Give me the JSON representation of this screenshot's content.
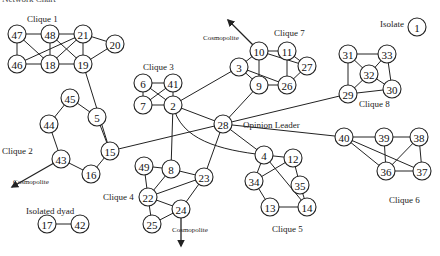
{
  "title": "Network Chart",
  "labels": {
    "clique1": {
      "text": "Clique 1",
      "x": 27,
      "y": 22
    },
    "clique2": {
      "text": "Clique 2",
      "x": 2,
      "y": 154
    },
    "clique3": {
      "text": "Clique 3",
      "x": 143,
      "y": 70
    },
    "clique4": {
      "text": "Clique 4",
      "x": 103,
      "y": 200
    },
    "clique5": {
      "text": "Clique 5",
      "x": 272,
      "y": 232
    },
    "clique6": {
      "text": "Clique 6",
      "x": 389,
      "y": 203
    },
    "clique7": {
      "text": "Clique 7",
      "x": 274,
      "y": 36
    },
    "clique8": {
      "text": "Clique 8",
      "x": 359,
      "y": 107
    },
    "isolate": {
      "text": "Isolate",
      "x": 380,
      "y": 27
    },
    "isolated_dyad": {
      "text": "Isolated dyad",
      "x": 26,
      "y": 214
    },
    "opinion_leader": {
      "text": "Opinion Leader",
      "x": 243,
      "y": 128
    },
    "cosmopolite_top": {
      "text": "Cosmopolite",
      "x": 203,
      "y": 40
    },
    "cosmopolite_left": {
      "text": "Cosmopolite",
      "x": 13,
      "y": 184
    },
    "cosmopolite_bottom": {
      "text": "Cosmopolite",
      "x": 172,
      "y": 232
    }
  },
  "nodes": [
    {
      "id": "47",
      "x": 17,
      "y": 34
    },
    {
      "id": "48",
      "x": 50,
      "y": 34
    },
    {
      "id": "21",
      "x": 83,
      "y": 34
    },
    {
      "id": "20",
      "x": 115,
      "y": 44
    },
    {
      "id": "46",
      "x": 17,
      "y": 64
    },
    {
      "id": "18",
      "x": 50,
      "y": 64
    },
    {
      "id": "19",
      "x": 83,
      "y": 64
    },
    {
      "id": "6",
      "x": 143,
      "y": 83
    },
    {
      "id": "41",
      "x": 173,
      "y": 83
    },
    {
      "id": "7",
      "x": 143,
      "y": 105
    },
    {
      "id": "2",
      "x": 173,
      "y": 105
    },
    {
      "id": "45",
      "x": 70,
      "y": 98
    },
    {
      "id": "5",
      "x": 97,
      "y": 117
    },
    {
      "id": "44",
      "x": 49,
      "y": 124
    },
    {
      "id": "15",
      "x": 110,
      "y": 151
    },
    {
      "id": "43",
      "x": 61,
      "y": 159
    },
    {
      "id": "16",
      "x": 91,
      "y": 174
    },
    {
      "id": "17",
      "x": 47,
      "y": 224
    },
    {
      "id": "42",
      "x": 80,
      "y": 224
    },
    {
      "id": "28",
      "x": 223,
      "y": 124
    },
    {
      "id": "10",
      "x": 259,
      "y": 51
    },
    {
      "id": "11",
      "x": 287,
      "y": 51
    },
    {
      "id": "27",
      "x": 307,
      "y": 66
    },
    {
      "id": "3",
      "x": 239,
      "y": 67
    },
    {
      "id": "9",
      "x": 259,
      "y": 85
    },
    {
      "id": "26",
      "x": 287,
      "y": 85
    },
    {
      "id": "31",
      "x": 348,
      "y": 54
    },
    {
      "id": "33",
      "x": 387,
      "y": 54
    },
    {
      "id": "32",
      "x": 369,
      "y": 74
    },
    {
      "id": "29",
      "x": 348,
      "y": 94
    },
    {
      "id": "30",
      "x": 392,
      "y": 89
    },
    {
      "id": "1",
      "x": 417,
      "y": 27
    },
    {
      "id": "40",
      "x": 344,
      "y": 137
    },
    {
      "id": "39",
      "x": 384,
      "y": 137
    },
    {
      "id": "38",
      "x": 419,
      "y": 137
    },
    {
      "id": "36",
      "x": 386,
      "y": 171
    },
    {
      "id": "37",
      "x": 422,
      "y": 171
    },
    {
      "id": "4",
      "x": 264,
      "y": 155
    },
    {
      "id": "12",
      "x": 293,
      "y": 158
    },
    {
      "id": "34",
      "x": 254,
      "y": 181
    },
    {
      "id": "35",
      "x": 300,
      "y": 185
    },
    {
      "id": "13",
      "x": 270,
      "y": 207
    },
    {
      "id": "14",
      "x": 307,
      "y": 207
    },
    {
      "id": "49",
      "x": 144,
      "y": 166
    },
    {
      "id": "8",
      "x": 171,
      "y": 169
    },
    {
      "id": "23",
      "x": 204,
      "y": 177
    },
    {
      "id": "22",
      "x": 148,
      "y": 197
    },
    {
      "id": "24",
      "x": 181,
      "y": 209
    },
    {
      "id": "25",
      "x": 152,
      "y": 224
    }
  ],
  "edges": [
    [
      "47",
      "48"
    ],
    [
      "48",
      "21"
    ],
    [
      "21",
      "20"
    ],
    [
      "47",
      "46"
    ],
    [
      "46",
      "18"
    ],
    [
      "18",
      "19"
    ],
    [
      "19",
      "20"
    ],
    [
      "47",
      "18"
    ],
    [
      "48",
      "18"
    ],
    [
      "48",
      "19"
    ],
    [
      "21",
      "18"
    ],
    [
      "21",
      "19"
    ],
    [
      "21",
      "46"
    ],
    [
      "19",
      "15"
    ],
    [
      "6",
      "41"
    ],
    [
      "6",
      "7"
    ],
    [
      "7",
      "2"
    ],
    [
      "41",
      "2"
    ],
    [
      "6",
      "2"
    ],
    [
      "41",
      "7"
    ],
    [
      "45",
      "44"
    ],
    [
      "45",
      "5"
    ],
    [
      "5",
      "15"
    ],
    [
      "44",
      "43"
    ],
    [
      "43",
      "16"
    ],
    [
      "16",
      "15"
    ],
    [
      "17",
      "42"
    ],
    [
      "2",
      "3"
    ],
    [
      "2",
      "28"
    ],
    [
      "2",
      "8"
    ],
    [
      "15",
      "28"
    ],
    [
      "28",
      "9"
    ],
    [
      "28",
      "29"
    ],
    [
      "28",
      "40"
    ],
    [
      "28",
      "4"
    ],
    [
      "28",
      "23"
    ],
    [
      "3",
      "10"
    ],
    [
      "3",
      "9"
    ],
    [
      "3",
      "26"
    ],
    [
      "10",
      "11"
    ],
    [
      "10",
      "27"
    ],
    [
      "10",
      "9"
    ],
    [
      "11",
      "26"
    ],
    [
      "11",
      "27"
    ],
    [
      "27",
      "26"
    ],
    [
      "9",
      "26"
    ],
    [
      "31",
      "33"
    ],
    [
      "31",
      "32"
    ],
    [
      "31",
      "29"
    ],
    [
      "33",
      "32"
    ],
    [
      "33",
      "30"
    ],
    [
      "32",
      "29"
    ],
    [
      "32",
      "30"
    ],
    [
      "29",
      "30"
    ],
    [
      "40",
      "39"
    ],
    [
      "40",
      "36"
    ],
    [
      "40",
      "37"
    ],
    [
      "39",
      "38"
    ],
    [
      "39",
      "36"
    ],
    [
      "38",
      "36"
    ],
    [
      "38",
      "37"
    ],
    [
      "36",
      "37"
    ],
    [
      "4",
      "12"
    ],
    [
      "4",
      "34"
    ],
    [
      "4",
      "14"
    ],
    [
      "12",
      "34"
    ],
    [
      "12",
      "35"
    ],
    [
      "35",
      "14"
    ],
    [
      "34",
      "13"
    ],
    [
      "13",
      "14"
    ],
    [
      "49",
      "8"
    ],
    [
      "49",
      "22"
    ],
    [
      "8",
      "22"
    ],
    [
      "8",
      "23"
    ],
    [
      "22",
      "23"
    ],
    [
      "22",
      "24"
    ],
    [
      "22",
      "25"
    ],
    [
      "23",
      "24"
    ],
    [
      "24",
      "25"
    ]
  ],
  "curves": [
    {
      "from": "2",
      "to": "4",
      "d": "M 173 105 C 180 140, 220 150, 264 155"
    }
  ],
  "arrows": [
    {
      "name": "cosmopolite-arrow-top",
      "x1": 259,
      "y1": 51,
      "x2": 228,
      "y2": 20
    },
    {
      "name": "cosmopolite-arrow-left",
      "x1": 61,
      "y1": 159,
      "x2": 12,
      "y2": 187
    },
    {
      "name": "cosmopolite-arrow-bottom",
      "x1": 181,
      "y1": 209,
      "x2": 181,
      "y2": 246
    }
  ]
}
